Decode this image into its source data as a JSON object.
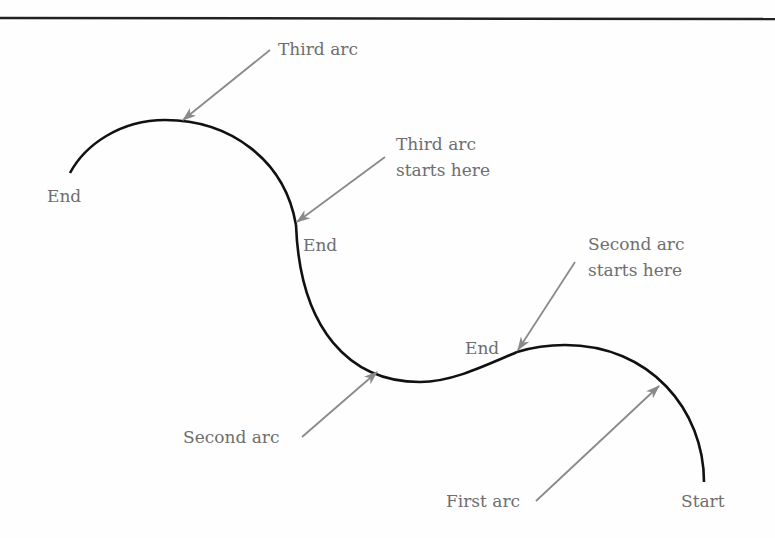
{
  "diagram": {
    "title": "",
    "colors": {
      "curve": "#111111",
      "arrow": "#8a8a8a",
      "label": "#6e6e6e",
      "rule": "#222222"
    },
    "labels": {
      "third_arc": "Third arc",
      "third_arc_starts_line1": "Third arc",
      "third_arc_starts_line2": "starts here",
      "end_left": "End",
      "end_middle": "End",
      "end_lower": "End",
      "second_arc_starts_line1": "Second arc",
      "second_arc_starts_line2": "starts here",
      "second_arc": "Second arc",
      "first_arc": "First arc",
      "start": "Start"
    },
    "arcs": [
      {
        "name": "First arc",
        "from": "Start",
        "to": "End (second arc starts here)"
      },
      {
        "name": "Second arc",
        "from": "Second arc starts here",
        "to": "End (third arc starts here)"
      },
      {
        "name": "Third arc",
        "from": "Third arc starts here",
        "to": "End"
      }
    ]
  }
}
